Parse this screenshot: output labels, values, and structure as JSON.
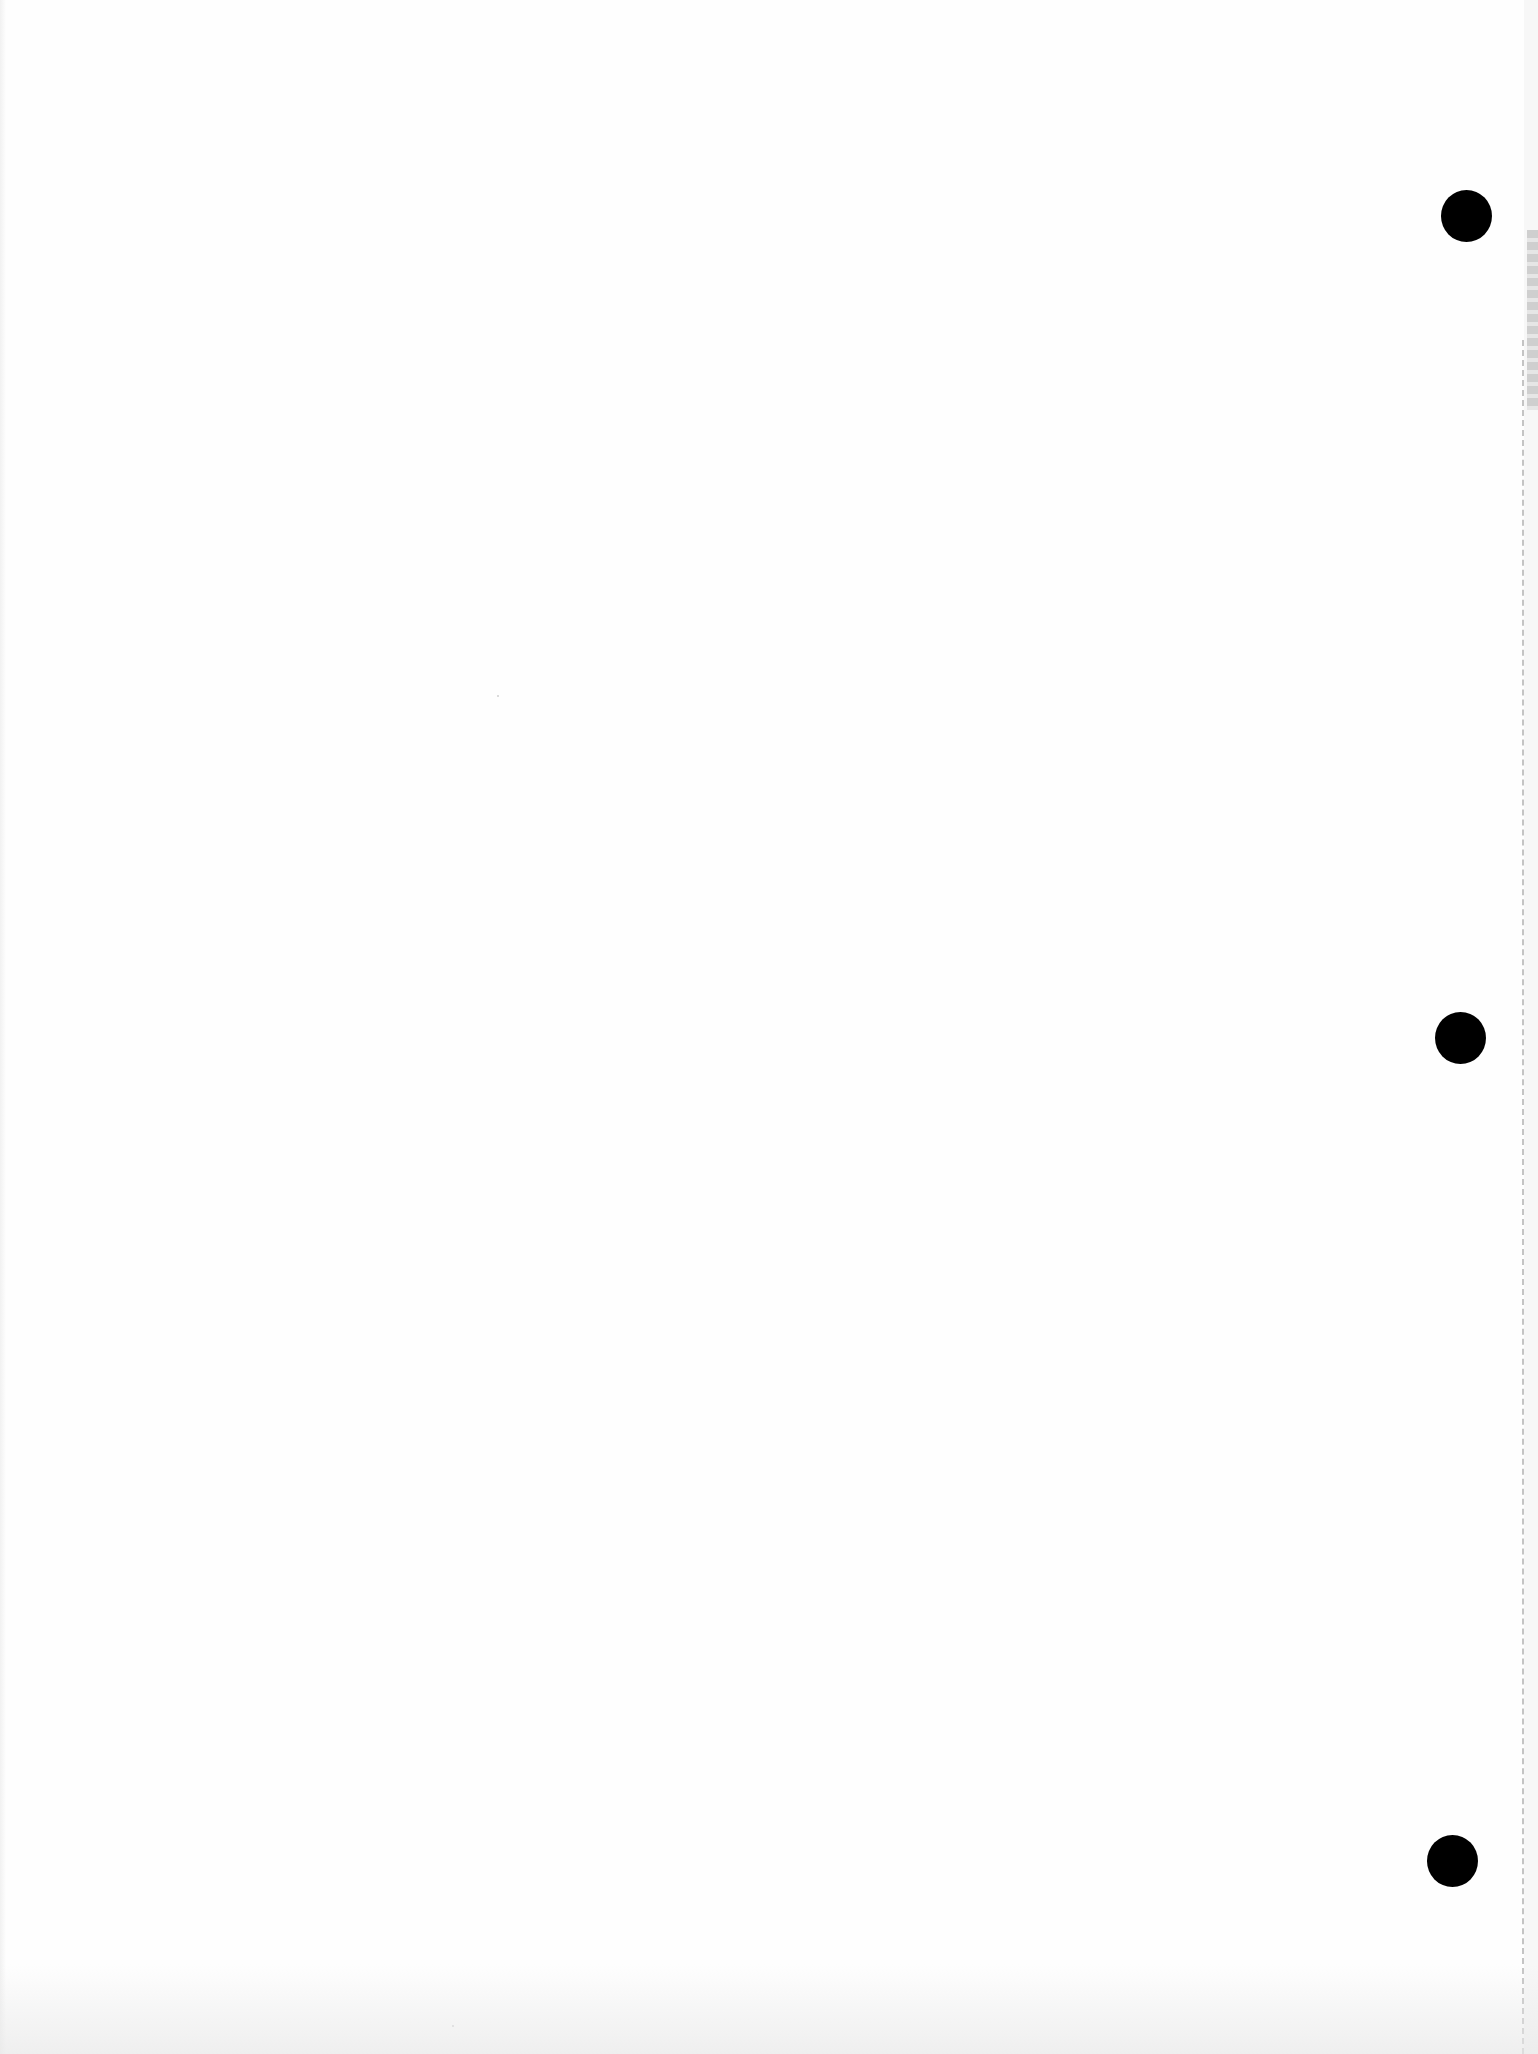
{
  "document": {
    "type": "scanned blank hole-punched paper",
    "text_content": "",
    "background_color": "#fefefe",
    "punch_holes": [
      {
        "position": "top",
        "color": "#000000"
      },
      {
        "position": "middle",
        "color": "#000000"
      },
      {
        "position": "bottom",
        "color": "#000000"
      }
    ],
    "perforation_edge": "right",
    "perforation_color": "#c4c4c4"
  }
}
